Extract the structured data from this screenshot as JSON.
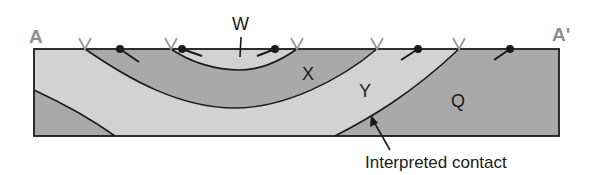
{
  "diagram": {
    "type": "geologic-cross-section",
    "section_labels": {
      "start": "A",
      "end": "A'"
    },
    "units": [
      {
        "id": "W",
        "label": "W",
        "fill": "#d2d2d2"
      },
      {
        "id": "X",
        "label": "X",
        "fill": "#a9a9a9"
      },
      {
        "id": "Y",
        "label": "Y",
        "fill": "#d2d2d2"
      },
      {
        "id": "Q",
        "label": "Q",
        "fill": "#a9a9a9"
      }
    ],
    "annotation": {
      "text": "Interpreted contact"
    },
    "surface_symbols": {
      "contact_marks": [
        "V",
        "V",
        "V",
        "V",
        "V"
      ],
      "dip_symbols": 5
    },
    "colors": {
      "light_unit": "#d2d2d2",
      "dark_unit": "#a9a9a9",
      "outline": "#1a1a1a",
      "end_label": "#8e8e8e",
      "contact_mark": "#9a9a9a"
    }
  }
}
